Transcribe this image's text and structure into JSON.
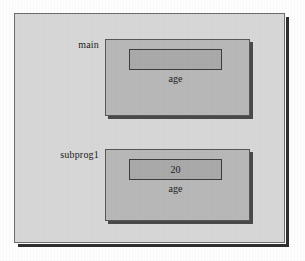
{
  "figure": {
    "type": "scope-nesting-diagram",
    "background_color": "#d9d9d9",
    "scope_fill_color": "#b9b9b9",
    "variable_fill_color": "#ababab",
    "border_color": "#585858"
  },
  "scopes": [
    {
      "label": "main",
      "variable": {
        "name": "age",
        "value": ""
      }
    },
    {
      "label": "subprog1",
      "variable": {
        "name": "age",
        "value": "20"
      }
    }
  ]
}
